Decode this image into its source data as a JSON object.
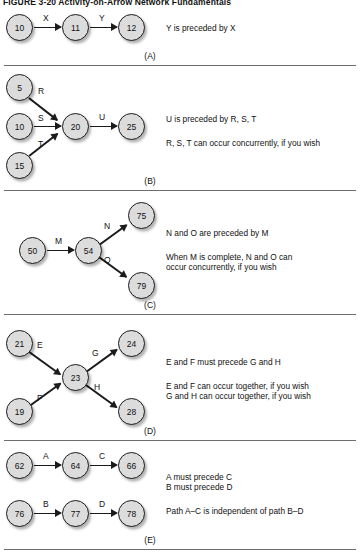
{
  "figure": {
    "title": "FIGURE 3-20   Activity-on-Arrow Network Fundamentals"
  },
  "panels": [
    {
      "letter": "(A)",
      "nodes": [
        {
          "id": "a1",
          "label": "10"
        },
        {
          "id": "a2",
          "label": "11"
        },
        {
          "id": "a3",
          "label": "12"
        }
      ],
      "edges": [
        {
          "label": "X",
          "from": "10",
          "to": "11"
        },
        {
          "label": "Y",
          "from": "11",
          "to": "12"
        }
      ],
      "notes": [
        "Y is preceded by X"
      ]
    },
    {
      "letter": "(B)",
      "nodes": [
        {
          "id": "b1",
          "label": "5"
        },
        {
          "id": "b2",
          "label": "10"
        },
        {
          "id": "b3",
          "label": "15"
        },
        {
          "id": "b4",
          "label": "20"
        },
        {
          "id": "b5",
          "label": "25"
        }
      ],
      "edges": [
        {
          "label": "R",
          "from": "5",
          "to": "20"
        },
        {
          "label": "S",
          "from": "10",
          "to": "20"
        },
        {
          "label": "T",
          "from": "15",
          "to": "20"
        },
        {
          "label": "U",
          "from": "20",
          "to": "25"
        }
      ],
      "notes": [
        "U is preceded by R, S, T",
        "R, S, T can occur concurrently, if you wish"
      ]
    },
    {
      "letter": "(C)",
      "nodes": [
        {
          "id": "c1",
          "label": "50"
        },
        {
          "id": "c2",
          "label": "54"
        },
        {
          "id": "c3",
          "label": "75"
        },
        {
          "id": "c4",
          "label": "79"
        }
      ],
      "edges": [
        {
          "label": "M",
          "from": "50",
          "to": "54"
        },
        {
          "label": "N",
          "from": "54",
          "to": "75"
        },
        {
          "label": "O",
          "from": "54",
          "to": "79"
        }
      ],
      "notes": [
        "N and O are preceded by M",
        "When M is complete, N and O can",
        "occur concurrently, if you wish"
      ]
    },
    {
      "letter": "(D)",
      "nodes": [
        {
          "id": "d1",
          "label": "21"
        },
        {
          "id": "d2",
          "label": "19"
        },
        {
          "id": "d3",
          "label": "23"
        },
        {
          "id": "d4",
          "label": "24"
        },
        {
          "id": "d5",
          "label": "28"
        }
      ],
      "edges": [
        {
          "label": "E",
          "from": "21",
          "to": "23"
        },
        {
          "label": "F",
          "from": "19",
          "to": "23"
        },
        {
          "label": "G",
          "from": "23",
          "to": "24"
        },
        {
          "label": "H",
          "from": "23",
          "to": "28"
        }
      ],
      "notes": [
        "E and F must precede G and H",
        "E and F can occur together, if you wish",
        "G and H can occur together, if you wish"
      ]
    },
    {
      "letter": "(E)",
      "nodes": [
        {
          "id": "e1",
          "label": "62"
        },
        {
          "id": "e2",
          "label": "64"
        },
        {
          "id": "e3",
          "label": "66"
        },
        {
          "id": "e4",
          "label": "76"
        },
        {
          "id": "e5",
          "label": "77"
        },
        {
          "id": "e6",
          "label": "78"
        }
      ],
      "edges": [
        {
          "label": "A",
          "from": "62",
          "to": "64"
        },
        {
          "label": "C",
          "from": "64",
          "to": "66"
        },
        {
          "label": "B",
          "from": "76",
          "to": "77"
        },
        {
          "label": "D",
          "from": "77",
          "to": "78"
        }
      ],
      "notes": [
        "A must precede C",
        "B must precede D",
        "Path A–C is independent of path B–D"
      ]
    }
  ]
}
